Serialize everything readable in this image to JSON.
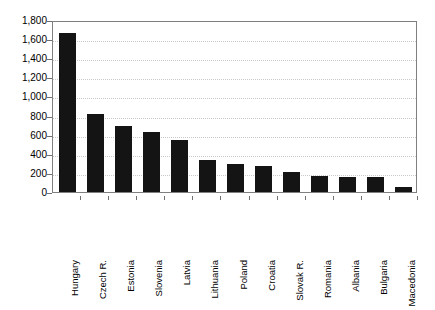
{
  "chart_data": {
    "type": "bar",
    "title": "",
    "xlabel": "",
    "ylabel": "",
    "ylim": [
      0,
      1800
    ],
    "ytick_step": 200,
    "grid": true,
    "legend": "none",
    "bar_color": "#141414",
    "grid_color": "#c9c9c9",
    "axis_color": "#808080",
    "categories": [
      "Hungary",
      "Czech R.",
      "Estonia",
      "Slovenia",
      "Latvia",
      "Lithuania",
      "Poland",
      "Croatia",
      "Slovak R.",
      "Romania",
      "Albania",
      "Bulgaria",
      "Macedonia"
    ],
    "values": [
      1660,
      820,
      690,
      630,
      545,
      330,
      295,
      270,
      205,
      165,
      160,
      155,
      50
    ],
    "ytick_labels": [
      "0",
      "200",
      "400",
      "600",
      "800",
      "1,000",
      "1,200",
      "1,400",
      "1,600",
      "1,800"
    ],
    "ytick_values": [
      0,
      200,
      400,
      600,
      800,
      1000,
      1200,
      1400,
      1600,
      1800
    ]
  }
}
